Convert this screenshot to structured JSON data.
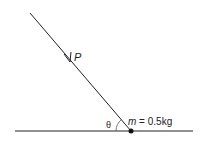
{
  "diagram": {
    "force_label": "P",
    "angle_label": "θ",
    "mass_symbol": "m",
    "mass_value": " = 0.5kg",
    "colors": {
      "line": "#222222",
      "background": "#ffffff"
    }
  }
}
